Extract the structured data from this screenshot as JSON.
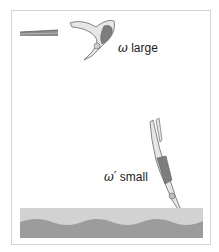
{
  "figure": {
    "labels": {
      "top": {
        "symbol": "ω",
        "text": " large"
      },
      "bottom": {
        "symbol": "ω′",
        "text": " small"
      }
    },
    "colors": {
      "frame": "#d4d4d4",
      "board": "#8a8a8a",
      "water_light": "#d2d2d2",
      "water_dark": "#9c9c9c",
      "skin": "#e6e6e6",
      "suit": "#7d7d7d"
    }
  }
}
